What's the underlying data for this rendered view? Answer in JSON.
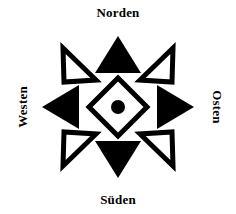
{
  "figure": {
    "background_color": "#ffffff",
    "ink_color": "#000000"
  },
  "labels": {
    "north": "Norden",
    "east": "Osten",
    "south": "Süden",
    "west": "Westen"
  },
  "rose": {
    "center_dot_color": "#000000",
    "cardinal_fill": "#000000",
    "ordinal_fill": "#ffffff",
    "ordinal_stroke": "#000000",
    "diamond_fill": "#ffffff",
    "diamond_stroke": "#000000",
    "cardinal_points": [
      {
        "name": "north",
        "style": "filled"
      },
      {
        "name": "east",
        "style": "filled"
      },
      {
        "name": "south",
        "style": "filled"
      },
      {
        "name": "west",
        "style": "filled"
      }
    ],
    "ordinal_points": [
      {
        "name": "northeast",
        "style": "outlined"
      },
      {
        "name": "southeast",
        "style": "outlined"
      },
      {
        "name": "southwest",
        "style": "outlined"
      },
      {
        "name": "northwest",
        "style": "outlined"
      }
    ]
  }
}
